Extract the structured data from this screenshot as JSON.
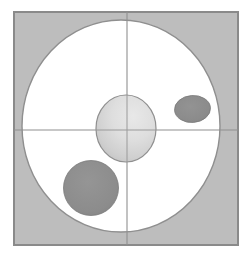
{
  "figure": {
    "canvas": {
      "width": 250,
      "height": 257,
      "background": "#ffffff"
    },
    "colors": {
      "background": "#ffffff",
      "frame_fill": "#bdbdbd",
      "frame_stroke": "#8a8a8a",
      "outer_region_fill": "#ffffff",
      "outer_region_stroke": "#8f8f8f",
      "core_fill_light": "#e3e3e3",
      "core_fill_dark": "#c4c4c4",
      "core_stroke": "#8f8f8f",
      "inclusion_fill": "#8d8d8d",
      "inclusion_stroke": "#7a7a7a",
      "axis_stroke": "#909090"
    },
    "frame": {
      "name": "outer square boundary",
      "x": 14,
      "y": 12,
      "width": 224,
      "height": 233,
      "stroke_width": 2
    },
    "outer_region": {
      "name": "large white ellipse",
      "cx": 121,
      "cy": 126,
      "rx": 99,
      "ry": 106,
      "stroke_width": 1.4
    },
    "core": {
      "name": "central graded circle",
      "cx": 126,
      "cy": 128.5,
      "rx": 30,
      "ry": 33.5,
      "stroke_width": 1.2
    },
    "axes": {
      "vertical": {
        "name": "vertical axis line",
        "x": 127,
        "y1": 12,
        "y2": 245,
        "stroke_width": 1.1
      },
      "horizontal": {
        "name": "horizontal axis line",
        "y": 130,
        "x1": 14,
        "x2": 238,
        "stroke_width": 1.1
      }
    },
    "inclusions": [
      {
        "id": "inclusion-upper-right",
        "label": "small dark ellipse (upper right quadrant)",
        "cx": 192.5,
        "cy": 109,
        "rx": 18,
        "ry": 13.5,
        "rotation": -4,
        "stroke_width": 0.8
      },
      {
        "id": "inclusion-lower-left",
        "label": "large dark ellipse (lower left quadrant)",
        "cx": 91,
        "cy": 188,
        "rx": 27.5,
        "ry": 27.5,
        "rotation": 0,
        "stroke_width": 0.8
      }
    ]
  }
}
